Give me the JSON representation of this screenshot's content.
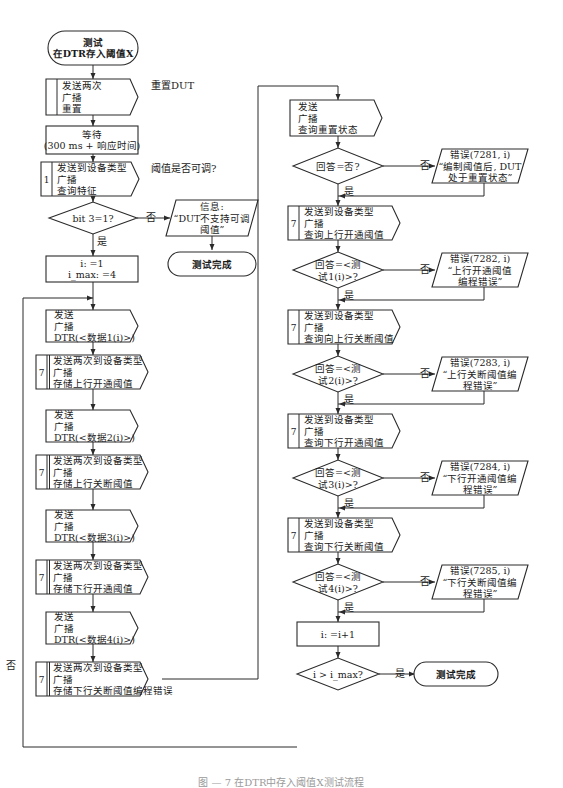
{
  "caption": "图 — 7  在DTR中存入阈值X测试流程",
  "edge_labels": {
    "yes": "是",
    "no": "否"
  },
  "left_column": {
    "start": [
      "测试",
      "在DTR存入阈值X"
    ],
    "reset": {
      "lines": [
        "发送两次",
        "广播",
        "重置"
      ],
      "note": "重置DUT"
    },
    "wait": [
      "等待",
      "(300 ms + 响应时间)"
    ],
    "query_features": {
      "index": "1",
      "lines": [
        "发送到设备类型",
        "广播",
        "查询特征"
      ],
      "note": "阈值是否可调?"
    },
    "bit_check": "bit 3=1?",
    "info_box": [
      "信息:",
      "“DUT不支持可调",
      "阈值”"
    ],
    "end_unsupported": "测试完成",
    "init": [
      "i: =1",
      "i_max: =4"
    ],
    "loop_steps": [
      {
        "index": "",
        "lines": [
          "发送",
          "广播",
          "DTR(<数据1(i)>)"
        ]
      },
      {
        "index": "7",
        "lines": [
          "发送两次到设备类型",
          "广播",
          "存储上行开通阈值"
        ]
      },
      {
        "index": "",
        "lines": [
          "发送",
          "广播",
          "DTR(<数据2(i)>)"
        ]
      },
      {
        "index": "7",
        "lines": [
          "发送两次到设备类型",
          "广播",
          "存储上行关断阈值"
        ]
      },
      {
        "index": "",
        "lines": [
          "发送",
          "广播",
          "DTR(<数据3(i)>)"
        ]
      },
      {
        "index": "7",
        "lines": [
          "发送两次到设备类型",
          "广播",
          "存储下行开通阈值"
        ]
      },
      {
        "index": "",
        "lines": [
          "发送",
          "广播",
          "DTR(<数据4(i)>)"
        ]
      },
      {
        "index": "7",
        "lines": [
          "发送两次到设备类型",
          "广播",
          "存储下行关断阈值编程错误"
        ]
      }
    ]
  },
  "right_column": {
    "query_reset": [
      "发送",
      "广播",
      "查询重置状态"
    ],
    "checks": [
      {
        "decision": [
          "回答=否?"
        ],
        "error": [
          "错误(7281, i)",
          "“编制阈值后, DUT",
          "处于重置状态”"
        ]
      },
      {
        "query": {
          "index": "7",
          "lines": [
            "发送到设备类型",
            "广播",
            "查询上行开通阈值"
          ]
        },
        "decision": [
          "回答=<测",
          "试1(i)>?"
        ],
        "error": [
          "错误(7282, i)",
          "“上行开通阈值",
          "编程错误”"
        ]
      },
      {
        "query": {
          "index": "7",
          "lines": [
            "发送到设备类型",
            "广播",
            "查询向上行关断阈值"
          ]
        },
        "decision": [
          "回答=<测",
          "试2(i)>?"
        ],
        "error": [
          "错误(7283, i)",
          "“上行关断阈值编",
          "程错误”"
        ]
      },
      {
        "query": {
          "index": "7",
          "lines": [
            "发送到设备类型",
            "广播",
            "查询下行开通阈值"
          ]
        },
        "decision": [
          "回答=<测",
          "试3(i)>?"
        ],
        "error": [
          "错误(7284, i)",
          "“下行开通阈值编",
          "程错误”"
        ]
      },
      {
        "query": {
          "index": "7",
          "lines": [
            "发送到设备类型",
            "广播",
            "查询下行关断阈值"
          ]
        },
        "decision": [
          "回答=<测",
          "试4(i)>?"
        ],
        "error": [
          "错误(7285, i)",
          "“下行关断阈值编",
          "程错误”"
        ]
      }
    ],
    "increment": "i: =i+1",
    "loop_check": "i > i_max?",
    "end": "测试完成"
  }
}
